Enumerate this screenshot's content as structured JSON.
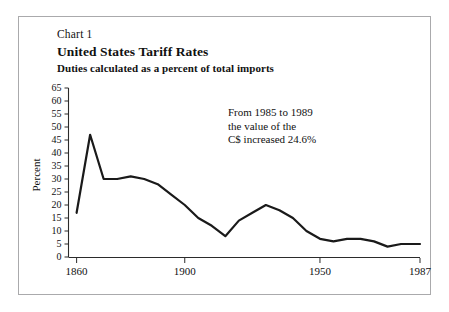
{
  "figure": {
    "chart_label": "Chart 1",
    "title": "United States Tariff Rates",
    "subtitle": "Duties calculated as a percent of total imports",
    "annotation": {
      "line1": "From 1985 to 1989",
      "line2": "the value of the",
      "line3": "C$ increased 24.6%"
    },
    "border_color": "#aaaaac",
    "line_color": "#1a1a1a",
    "axis_color": "#2b2b2b",
    "background": "#ffffff"
  },
  "chart_data": {
    "type": "line",
    "title": "United States Tariff Rates",
    "subtitle": "Duties calculated as a percent of total imports",
    "xlabel": "",
    "ylabel": "Percent",
    "xlim": [
      1857,
      1987
    ],
    "ylim": [
      0,
      65
    ],
    "grid": false,
    "legend": null,
    "y_ticks": [
      0,
      5,
      10,
      15,
      20,
      25,
      30,
      35,
      40,
      45,
      50,
      55,
      60,
      65
    ],
    "y_tick_labels": [
      "0",
      "5",
      "10",
      "15",
      "20",
      "25",
      "30",
      "35",
      "40",
      "45",
      "50",
      "55",
      "60",
      "65"
    ],
    "x_ticks": [
      1860,
      1900,
      1950,
      1987
    ],
    "x_tick_labels": [
      "1860",
      "1900",
      "1950",
      "1987"
    ],
    "annotations": [
      {
        "text": "From 1985 to 1989 the value of the C$ increased 24.6%",
        "x": 1930,
        "y": 52
      }
    ],
    "series": [
      {
        "name": "US tariff rate (duties as percent of total imports)",
        "x": [
          1860,
          1865,
          1870,
          1875,
          1880,
          1885,
          1890,
          1895,
          1900,
          1905,
          1910,
          1915,
          1920,
          1925,
          1930,
          1935,
          1940,
          1945,
          1950,
          1955,
          1960,
          1965,
          1970,
          1975,
          1980,
          1987
        ],
        "values": [
          17,
          47,
          30,
          30,
          31,
          30,
          28,
          24,
          20,
          15,
          12,
          8,
          14,
          17,
          20,
          18,
          15,
          10,
          7,
          6,
          7,
          7,
          6,
          4,
          5,
          5
        ]
      }
    ]
  },
  "axis_label": {
    "percent": "Percent"
  }
}
